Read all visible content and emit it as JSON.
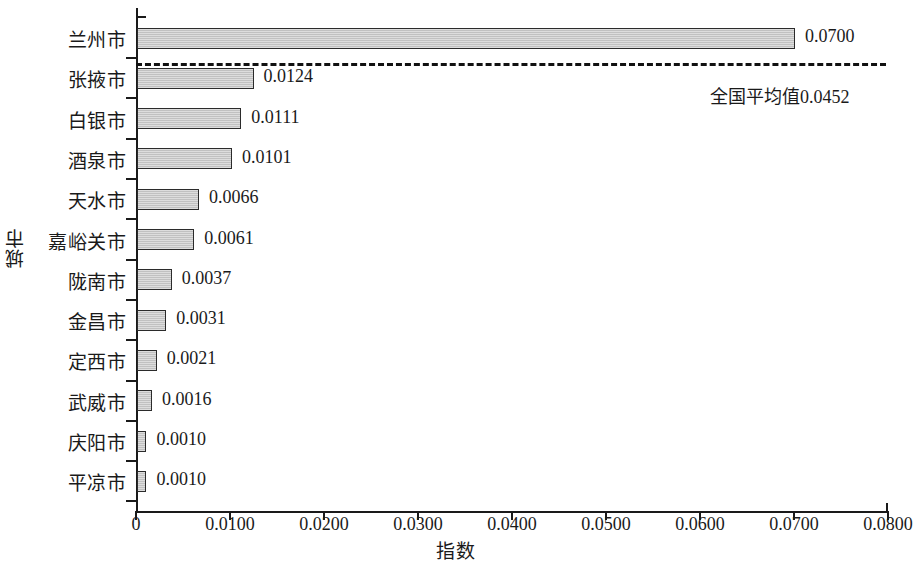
{
  "chart_data": {
    "type": "bar",
    "orientation": "horizontal",
    "title": "",
    "xlabel": "指数",
    "ylabel": "城市",
    "xlim": [
      0,
      0.08
    ],
    "grid": false,
    "legend": "none",
    "x_tick_labels": [
      "0",
      "0.0100",
      "0.0200",
      "0.0300",
      "0.0400",
      "0.0500",
      "0.0600",
      "0.0700",
      "0.0800"
    ],
    "x_tick_values": [
      0,
      0.01,
      0.02,
      0.03,
      0.04,
      0.05,
      0.06,
      0.07,
      0.08
    ],
    "categories": [
      "兰州市",
      "张掖市",
      "白银市",
      "酒泉市",
      "天水市",
      "嘉峪关市",
      "陇南市",
      "金昌市",
      "定西市",
      "武威市",
      "庆阳市",
      "平凉市"
    ],
    "values": [
      0.07,
      0.0124,
      0.0111,
      0.0101,
      0.0066,
      0.0061,
      0.0037,
      0.0031,
      0.0021,
      0.0016,
      0.001,
      0.001
    ],
    "value_labels": [
      "0.0700",
      "0.0124",
      "0.0111",
      "0.0101",
      "0.0066",
      "0.0061",
      "0.0037",
      "0.0031",
      "0.0021",
      "0.0016",
      "0.0010",
      "0.0010"
    ],
    "annotations": [
      {
        "name": "national-average",
        "label": "全国平均值0.0452",
        "value": 0.0452,
        "style": "dashed-horizontal-reference-line"
      }
    ],
    "colors": {
      "bar_fill": "#cbcbcb",
      "bar_border": "#2b2b2b",
      "axis": "#1a1a1a",
      "reference_line": "#111111",
      "background": "#ffffff"
    }
  }
}
